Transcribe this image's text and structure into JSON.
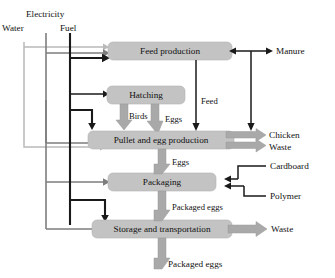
{
  "diagram": {
    "colors": {
      "process_fill": "#c3c3c3",
      "block_arrow": "#a9a9a9",
      "fuel_line": "#1a1a1a",
      "electricity_line": "#7d7d7d",
      "water_line": "#b9b9b9"
    },
    "inputs": [
      {
        "id": "electricity",
        "label": "Electricity"
      },
      {
        "id": "water",
        "label": "Water"
      },
      {
        "id": "fuel",
        "label": "Fuel"
      }
    ],
    "processes": [
      {
        "id": "feed_production",
        "label": "Feed production"
      },
      {
        "id": "hatching",
        "label": "Hatching"
      },
      {
        "id": "pullet_egg_production",
        "label": "Pullet and egg production"
      },
      {
        "id": "packaging",
        "label": "Packaging"
      },
      {
        "id": "storage_transportation",
        "label": "Storage and transportation"
      }
    ],
    "materials": [
      {
        "id": "manure",
        "label": "Manure"
      },
      {
        "id": "cardboard",
        "label": "Cardboard"
      },
      {
        "id": "polymer",
        "label": "Polymer"
      }
    ],
    "outputs": [
      {
        "id": "chicken",
        "label": "Chicken"
      },
      {
        "id": "waste_pullet",
        "label": "Waste"
      },
      {
        "id": "waste_storage",
        "label": "Waste"
      },
      {
        "id": "packaged_eggs_final",
        "label": "Packaged eggs"
      }
    ],
    "flows": [
      {
        "id": "feed",
        "label": "Feed"
      },
      {
        "id": "birds",
        "label": "Birds"
      },
      {
        "id": "eggs_up",
        "label": "Eggs"
      },
      {
        "id": "eggs_down",
        "label": "Eggs"
      },
      {
        "id": "packaged_eggs",
        "label": "Packaged eggs"
      }
    ]
  }
}
